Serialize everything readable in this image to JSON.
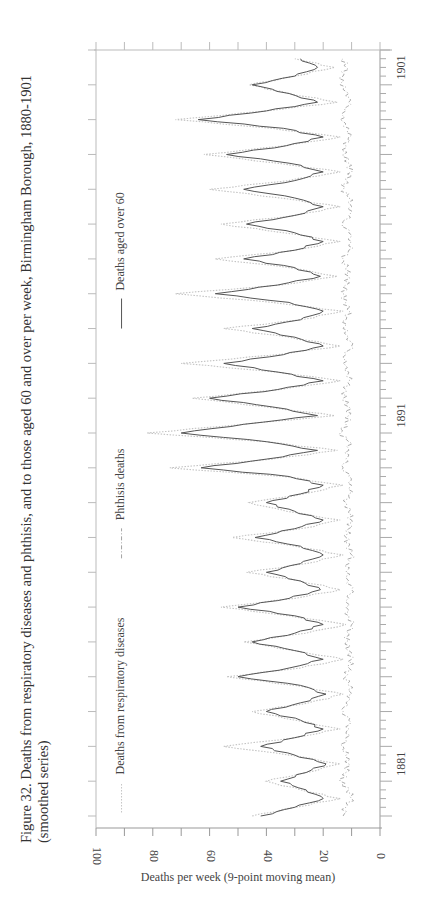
{
  "figure": {
    "title_line1": "Figure 32. Deaths from respiratory diseases and phthisis, and to those aged 60 and over per week, Birmingham Borough, 1880-1901",
    "title_line2": "(smoothed series)"
  },
  "legend": {
    "items": [
      {
        "label": "Deaths from respiratory diseases",
        "style": "dotted",
        "color": "#bdbdbd"
      },
      {
        "label": "Phthisis deaths",
        "style": "dash-dot",
        "color": "#9a9a9a"
      },
      {
        "label": "Deaths aged over 60",
        "style": "solid",
        "color": "#555555"
      }
    ]
  },
  "axes": {
    "ylabel": "Deaths per week (9-point moving mean)",
    "yticks": [
      "0",
      "20",
      "40",
      "60",
      "80",
      "100"
    ],
    "xticks": [
      "1881",
      "1891",
      "1901"
    ]
  },
  "chart_data": {
    "type": "line",
    "title": "Figure 32. Deaths from respiratory diseases and phthisis, and to those aged 60 and over per week, Birmingham Borough, 1880-1901 (smoothed series)",
    "xlabel": "",
    "ylabel": "Deaths per week (9-point moving mean)",
    "ylim": [
      0,
      100
    ],
    "xlim": [
      1880,
      1902
    ],
    "x_tick_labels": [
      "1881",
      "1891",
      "1901"
    ],
    "y_tick_labels": [
      0,
      20,
      40,
      60,
      80,
      100
    ],
    "grid": false,
    "legend_position": "top inside",
    "x": [
      1880.0,
      1880.25,
      1880.5,
      1880.75,
      1881.0,
      1881.25,
      1881.5,
      1881.75,
      1882.0,
      1882.25,
      1882.5,
      1882.75,
      1883.0,
      1883.25,
      1883.5,
      1883.75,
      1884.0,
      1884.25,
      1884.5,
      1884.75,
      1885.0,
      1885.25,
      1885.5,
      1885.75,
      1886.0,
      1886.25,
      1886.5,
      1886.75,
      1887.0,
      1887.25,
      1887.5,
      1887.75,
      1888.0,
      1888.25,
      1888.5,
      1888.75,
      1889.0,
      1889.25,
      1889.5,
      1889.75,
      1890.0,
      1890.25,
      1890.5,
      1890.75,
      1891.0,
      1891.25,
      1891.5,
      1891.75,
      1892.0,
      1892.25,
      1892.5,
      1892.75,
      1893.0,
      1893.25,
      1893.5,
      1893.75,
      1894.0,
      1894.25,
      1894.5,
      1894.75,
      1895.0,
      1895.25,
      1895.5,
      1895.75,
      1896.0,
      1896.25,
      1896.5,
      1896.75,
      1897.0,
      1897.25,
      1897.5,
      1897.75,
      1898.0,
      1898.25,
      1898.5,
      1898.75,
      1899.0,
      1899.25,
      1899.5,
      1899.75,
      1900.0,
      1900.25,
      1900.5,
      1900.75,
      1901.0,
      1901.25,
      1901.5,
      1901.75
    ],
    "series": [
      {
        "name": "Deaths from respiratory diseases",
        "values": [
          45,
          30,
          14,
          28,
          40,
          26,
          14,
          32,
          55,
          30,
          14,
          30,
          45,
          25,
          13,
          30,
          54,
          28,
          13,
          30,
          48,
          26,
          12,
          32,
          56,
          30,
          14,
          28,
          47,
          26,
          13,
          30,
          52,
          28,
          14,
          33,
          46,
          27,
          13,
          34,
          74,
          38,
          15,
          40,
          82,
          48,
          16,
          40,
          66,
          35,
          14,
          36,
          70,
          36,
          14,
          32,
          55,
          28,
          13,
          38,
          72,
          35,
          15,
          32,
          58,
          30,
          14,
          34,
          56,
          30,
          14,
          35,
          60,
          32,
          14,
          36,
          62,
          33,
          14,
          38,
          72,
          40,
          15,
          32,
          46,
          30,
          16,
          30
        ]
      },
      {
        "name": "Phthisis deaths",
        "values": [
          13,
          12,
          10,
          11,
          14,
          12,
          11,
          12,
          13,
          12,
          11,
          11,
          13,
          12,
          10,
          11,
          12,
          11,
          10,
          11,
          12,
          11,
          10,
          11,
          12,
          11,
          10,
          11,
          12,
          11,
          10,
          11,
          12,
          11,
          10,
          11,
          12,
          11,
          10,
          11,
          13,
          12,
          11,
          11,
          14,
          12,
          11,
          11,
          13,
          12,
          11,
          11,
          13,
          12,
          10,
          11,
          13,
          12,
          11,
          12,
          13,
          12,
          11,
          12,
          13,
          11,
          10,
          11,
          13,
          11,
          10,
          11,
          13,
          12,
          10,
          11,
          13,
          12,
          11,
          11,
          14,
          12,
          11,
          11,
          14,
          13,
          12,
          13
        ]
      },
      {
        "name": "Deaths aged over 60",
        "values": [
          42,
          30,
          20,
          26,
          35,
          26,
          19,
          30,
          42,
          30,
          20,
          28,
          40,
          28,
          19,
          28,
          50,
          32,
          20,
          30,
          45,
          30,
          20,
          30,
          50,
          32,
          21,
          28,
          40,
          28,
          20,
          28,
          44,
          30,
          20,
          30,
          40,
          28,
          20,
          32,
          63,
          40,
          22,
          40,
          70,
          48,
          22,
          38,
          60,
          36,
          20,
          36,
          55,
          34,
          20,
          30,
          45,
          28,
          20,
          32,
          58,
          36,
          21,
          30,
          48,
          30,
          20,
          30,
          47,
          30,
          20,
          30,
          48,
          30,
          20,
          32,
          54,
          33,
          20,
          34,
          64,
          40,
          22,
          32,
          45,
          30,
          22,
          28
        ]
      }
    ]
  }
}
